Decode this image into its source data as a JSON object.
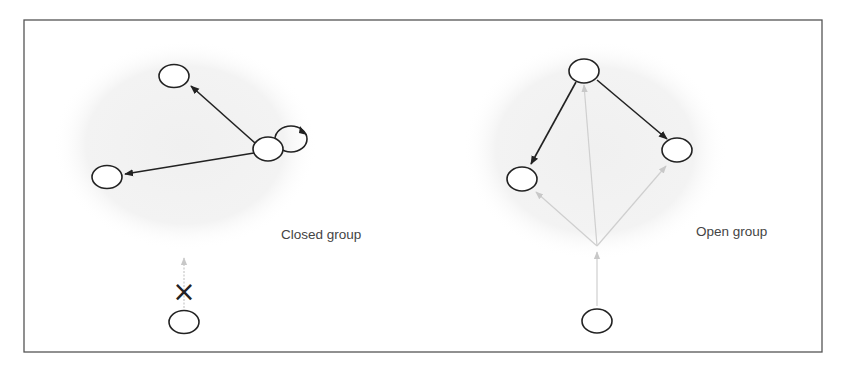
{
  "colors": {
    "frame": "#555555",
    "node_stroke": "#222222",
    "edge_dark": "#222222",
    "edge_light": "#c8c8c8",
    "group_fill": "#f2f2f2"
  },
  "closed_group": {
    "label": "Closed group",
    "blocked_marker": "×",
    "nodes": [
      "top",
      "left",
      "hub",
      "hub-self-loop",
      "outside-bottom"
    ],
    "edges": [
      {
        "from": "hub",
        "to": "top",
        "style": "dark"
      },
      {
        "from": "hub",
        "to": "left",
        "style": "dark"
      },
      {
        "from": "hub",
        "to": "hub",
        "style": "dark-self-loop"
      },
      {
        "from": "outside-bottom",
        "to": "group",
        "style": "light-blocked"
      }
    ]
  },
  "open_group": {
    "label": "Open group",
    "nodes": [
      "top",
      "left",
      "right",
      "outside-bottom"
    ],
    "edges": [
      {
        "from": "top",
        "to": "left",
        "style": "dark"
      },
      {
        "from": "top",
        "to": "right",
        "style": "dark"
      },
      {
        "from": "outside-bottom",
        "to": "top",
        "style": "light"
      },
      {
        "from": "outside-bottom",
        "to": "left",
        "style": "light"
      },
      {
        "from": "outside-bottom",
        "to": "right",
        "style": "light"
      }
    ]
  }
}
